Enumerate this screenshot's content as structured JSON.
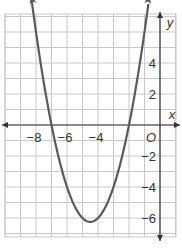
{
  "chart_data": {
    "type": "line",
    "title": "",
    "function": "y = (x + 7)(x + 2) = x^2 + 9x + 14",
    "xlabel": "x",
    "ylabel": "y",
    "origin_label": "O",
    "xlim": [
      -10,
      1
    ],
    "ylim": [
      -7,
      7
    ],
    "grid": true,
    "x_ticks": [
      "-8",
      "-6",
      "-4"
    ],
    "y_ticks": [
      "4",
      "2",
      "-2",
      "-4",
      "-6"
    ],
    "x_intercepts": [
      -7,
      -2
    ],
    "vertex": [
      -4.5,
      -6.25
    ],
    "points": [
      {
        "x": -8.3,
        "y": 8.29
      },
      {
        "x": -8,
        "y": 6
      },
      {
        "x": -7,
        "y": 0
      },
      {
        "x": -6,
        "y": -4
      },
      {
        "x": -5,
        "y": -6
      },
      {
        "x": -4.5,
        "y": -6.25
      },
      {
        "x": -4,
        "y": -6
      },
      {
        "x": -3,
        "y": -4
      },
      {
        "x": -2,
        "y": 0
      },
      {
        "x": -1,
        "y": 6
      },
      {
        "x": -0.7,
        "y": 8.29
      }
    ],
    "colors": {
      "curve": "#5a5a5a",
      "grid": "#c8c8c8",
      "axis": "#333333"
    }
  }
}
